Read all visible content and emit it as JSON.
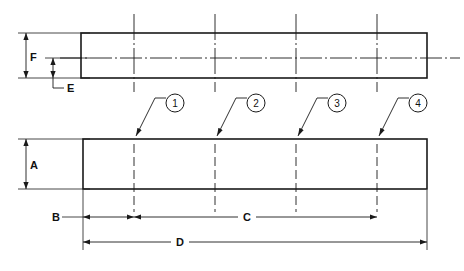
{
  "drawing": {
    "type": "technical-engineering-drawing",
    "description": "Two-view mechanical drawing of a rectangular bar with four hole locations and lettered dimensions",
    "background_color": "#ffffff",
    "line_color": "#1a1a1a",
    "views": [
      {
        "name": "top-view",
        "shape": "rectangle",
        "x": 81,
        "y": 33,
        "width": 346,
        "height": 45,
        "horizontal_centerline": true
      },
      {
        "name": "front-view",
        "shape": "rectangle",
        "x": 83,
        "y": 139,
        "width": 344,
        "height": 50,
        "horizontal_centerline": false
      }
    ],
    "centerlines": [
      {
        "name": "centerline-1",
        "x": 134
      },
      {
        "name": "centerline-2",
        "x": 215
      },
      {
        "name": "centerline-3",
        "x": 296
      },
      {
        "name": "centerline-4",
        "x": 377
      }
    ],
    "balloons": [
      {
        "label": "1",
        "cx": 175,
        "cy": 103,
        "r": 9,
        "leader_elbow_x": 155,
        "leader_elbow_y": 98,
        "arrow_x": 134,
        "arrow_y": 139
      },
      {
        "label": "2",
        "cx": 256,
        "cy": 103,
        "r": 9,
        "leader_elbow_x": 236,
        "leader_elbow_y": 98,
        "arrow_x": 215,
        "arrow_y": 139
      },
      {
        "label": "3",
        "cx": 337,
        "cy": 103,
        "r": 9,
        "leader_elbow_x": 317,
        "leader_elbow_y": 98,
        "arrow_x": 296,
        "arrow_y": 139
      },
      {
        "label": "4",
        "cx": 418,
        "cy": 103,
        "r": 9,
        "leader_elbow_x": 398,
        "leader_elbow_y": 98,
        "arrow_x": 377,
        "arrow_y": 139
      }
    ],
    "dimensions": [
      {
        "label": "F",
        "orientation": "vertical",
        "line_x": 26,
        "from": 33,
        "to": 78,
        "label_x": 29,
        "label_y": 60,
        "description": "overall width of top view"
      },
      {
        "label": "E",
        "orientation": "vertical",
        "line_x": 53,
        "from": 58,
        "to": 78,
        "label_x": 69,
        "label_y": 88,
        "description": "centerline offset from bottom edge in top view"
      },
      {
        "label": "A",
        "orientation": "vertical",
        "line_x": 26,
        "from": 139,
        "to": 189,
        "label_x": 29,
        "label_y": 168,
        "description": "height of front view"
      },
      {
        "label": "B",
        "orientation": "horizontal",
        "line_y": 217,
        "from": 83,
        "to": 134,
        "label_x": 53,
        "label_y": 221,
        "description": "edge to first hole centerline"
      },
      {
        "label": "C",
        "orientation": "horizontal",
        "line_y": 217,
        "from": 134,
        "to": 377,
        "label_x": 247,
        "label_y": 221,
        "description": "first hole centerline to last hole centerline"
      },
      {
        "label": "D",
        "orientation": "horizontal",
        "line_y": 242,
        "from": 83,
        "to": 427,
        "label_x": 180,
        "label_y": 246,
        "description": "overall length"
      }
    ]
  }
}
